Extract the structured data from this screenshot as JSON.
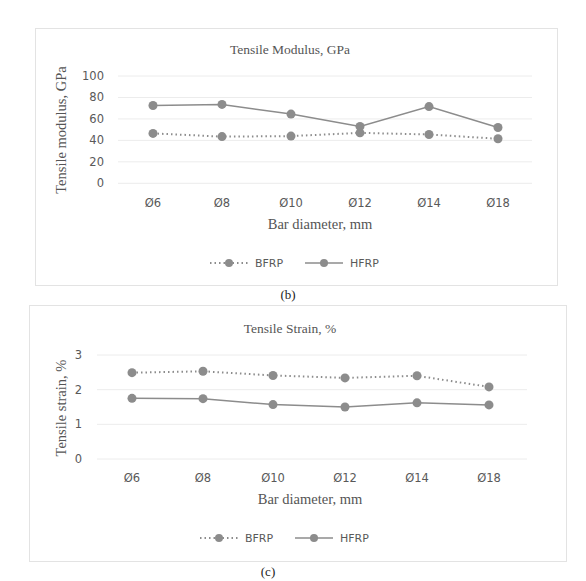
{
  "chart_data": [
    {
      "type": "line",
      "title": "Tensile Modulus, GPa",
      "xlabel": "Bar diameter, mm",
      "ylabel": "Tensile modulus, GPa",
      "categories": [
        "Ø6",
        "Ø8",
        "Ø10",
        "Ø12",
        "Ø14",
        "Ø18"
      ],
      "yticks": [
        "0",
        "20",
        "40",
        "60",
        "80",
        "100"
      ],
      "ylim": [
        0,
        100
      ],
      "grid": true,
      "legend_position": "bottom",
      "series": [
        {
          "name": "BFRP",
          "style": "dotted",
          "marker": "circle",
          "values": [
            46.5,
            43.5,
            44,
            47,
            45.5,
            41.5
          ]
        },
        {
          "name": "HFRP",
          "style": "solid",
          "marker": "circle",
          "values": [
            72.5,
            73.5,
            64.5,
            53,
            71.5,
            52
          ]
        }
      ],
      "caption": "(b)"
    },
    {
      "type": "line",
      "title": "Tensile Strain, %",
      "xlabel": "Bar diameter, mm",
      "ylabel": "Tensile strain, %",
      "categories": [
        "Ø6",
        "Ø8",
        "Ø10",
        "Ø12",
        "Ø14",
        "Ø18"
      ],
      "yticks": [
        "0",
        "1",
        "2",
        "3"
      ],
      "ylim": [
        0,
        3
      ],
      "grid": true,
      "legend_position": "bottom",
      "series": [
        {
          "name": "BFRP",
          "style": "dotted",
          "marker": "circle",
          "values": [
            2.49,
            2.53,
            2.41,
            2.34,
            2.4,
            2.08
          ]
        },
        {
          "name": "HFRP",
          "style": "solid",
          "marker": "circle",
          "values": [
            1.75,
            1.74,
            1.57,
            1.5,
            1.62,
            1.56
          ]
        }
      ],
      "caption": "(c)"
    }
  ],
  "colors": {
    "series": "#8c8c8c",
    "grid": "#ececec",
    "border": "#e3e3e3",
    "text": "#595959"
  }
}
